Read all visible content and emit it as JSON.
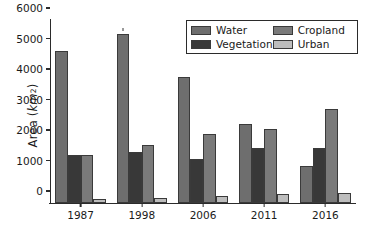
{
  "chart_data": {
    "type": "bar",
    "title": "",
    "xlabel": "",
    "ylabel": "Area (km^2)",
    "ylabel_parts": {
      "prefix": "Area (",
      "italic": "km",
      "sup": "2",
      "suffix": ")"
    },
    "categories": [
      "1987",
      "1998",
      "2006",
      "2011",
      "2016"
    ],
    "series": [
      {
        "name": "Water",
        "color": "#6e6e6e",
        "values": [
          5000,
          5530,
          4120,
          2600,
          1220
        ]
      },
      {
        "name": "Vegetation",
        "color": "#383838",
        "values": [
          1590,
          1660,
          1450,
          1800,
          1790
        ]
      },
      {
        "name": "Cropland",
        "color": "#7a7a7a",
        "values": [
          1560,
          1910,
          2260,
          2440,
          3070
        ]
      },
      {
        "name": "Urban",
        "color": "#bdbdbd",
        "values": [
          120,
          170,
          230,
          290,
          340
        ]
      }
    ],
    "ylim": [
      0,
      6000
    ],
    "yticks": [
      0,
      1000,
      2000,
      3000,
      4000,
      5000,
      6000
    ],
    "ytick_labels": [
      "0",
      "1000",
      "2000",
      "3000",
      "4000",
      "5000",
      "6000"
    ],
    "grid": false,
    "legend_position": "upper right",
    "legend_columns": 2,
    "legend_order": [
      "Water",
      "Cropland",
      "Vegetation",
      "Urban"
    ]
  }
}
